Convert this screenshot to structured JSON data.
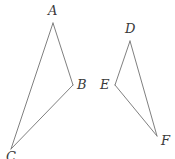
{
  "figure": {
    "kind": "geometry-diagram",
    "canvas": {
      "width": 175,
      "height": 159,
      "background": "#ffffff"
    },
    "style": {
      "stroke_color": "#808080",
      "stroke_width": 1,
      "label_color": "#3a3a3a",
      "label_style": "italic-serif",
      "label_font_size": 13
    },
    "shapes": [
      {
        "name": "triangle-abc",
        "vertices": [
          {
            "id": "A",
            "label": "A",
            "x": 53,
            "y": 23,
            "label_x": 48,
            "label_y": 4
          },
          {
            "id": "B",
            "label": "B",
            "x": 73,
            "y": 85,
            "label_x": 77,
            "label_y": 78
          },
          {
            "id": "C",
            "label": "C",
            "x": 11,
            "y": 149,
            "label_x": 6,
            "label_y": 150
          }
        ],
        "edges": [
          {
            "name": "edge-ab",
            "from": "A",
            "to": "B"
          },
          {
            "name": "edge-bc",
            "from": "B",
            "to": "C"
          },
          {
            "name": "edge-ca",
            "from": "C",
            "to": "A"
          }
        ]
      },
      {
        "name": "triangle-def",
        "vertices": [
          {
            "id": "D",
            "label": "D",
            "x": 130,
            "y": 41,
            "label_x": 125,
            "label_y": 22
          },
          {
            "id": "E",
            "label": "E",
            "x": 115,
            "y": 85,
            "label_x": 100,
            "label_y": 78
          },
          {
            "id": "F",
            "label": "F",
            "x": 157,
            "y": 136,
            "label_x": 161,
            "label_y": 134
          }
        ],
        "edges": [
          {
            "name": "edge-de",
            "from": "D",
            "to": "E"
          },
          {
            "name": "edge-ef",
            "from": "E",
            "to": "F"
          },
          {
            "name": "edge-fd",
            "from": "F",
            "to": "D"
          }
        ]
      }
    ]
  }
}
